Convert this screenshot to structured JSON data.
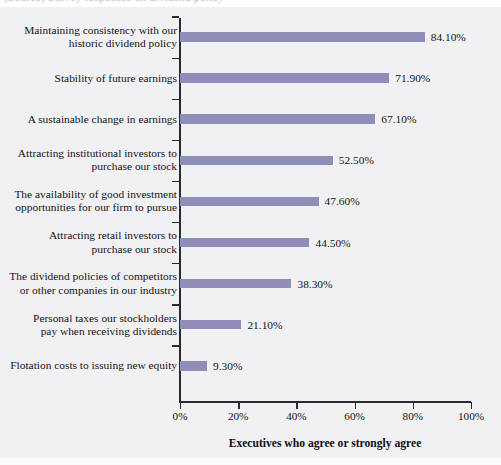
{
  "figure": {
    "clipped_top_text": "(Source) Survey responses on dividend policy",
    "background_color": "#f1f1f3",
    "bar_color": "#8e8eb8",
    "axis_color": "#2a2a30",
    "text_color": "#15131a"
  },
  "chart_data": {
    "type": "bar",
    "orientation": "horizontal",
    "title": "",
    "xlabel": "Executives who agree or strongly agree",
    "ylabel": "",
    "xlim": [
      0,
      100
    ],
    "xticks": [
      0,
      20,
      40,
      60,
      80,
      100
    ],
    "xtick_labels": [
      "0%",
      "20%",
      "40%",
      "60%",
      "80%",
      "100%"
    ],
    "grid": false,
    "legend": false,
    "value_label_suffix": "%",
    "categories": [
      "Maintaining consistency with our\nhistoric dividend policy",
      "Stability of future earnings",
      "A sustainable change in earnings",
      "Attracting institutional investors to\npurchase our stock",
      "The availability of good investment\nopportunities for our firm to pursue",
      "Attracting retail investors to\npurchase our stock",
      "The dividend policies of competitors\nor other companies in our industry",
      "Personal taxes our stockholders\npay when receiving dividends",
      "Flotation costs to issuing new equity"
    ],
    "values": [
      84.1,
      71.9,
      67.1,
      52.5,
      47.6,
      44.5,
      38.3,
      21.1,
      9.3
    ],
    "value_labels": [
      "84.10%",
      "71.90%",
      "67.10%",
      "52.50%",
      "47.60%",
      "44.50%",
      "38.30%",
      "21.10%",
      "9.30%"
    ]
  }
}
